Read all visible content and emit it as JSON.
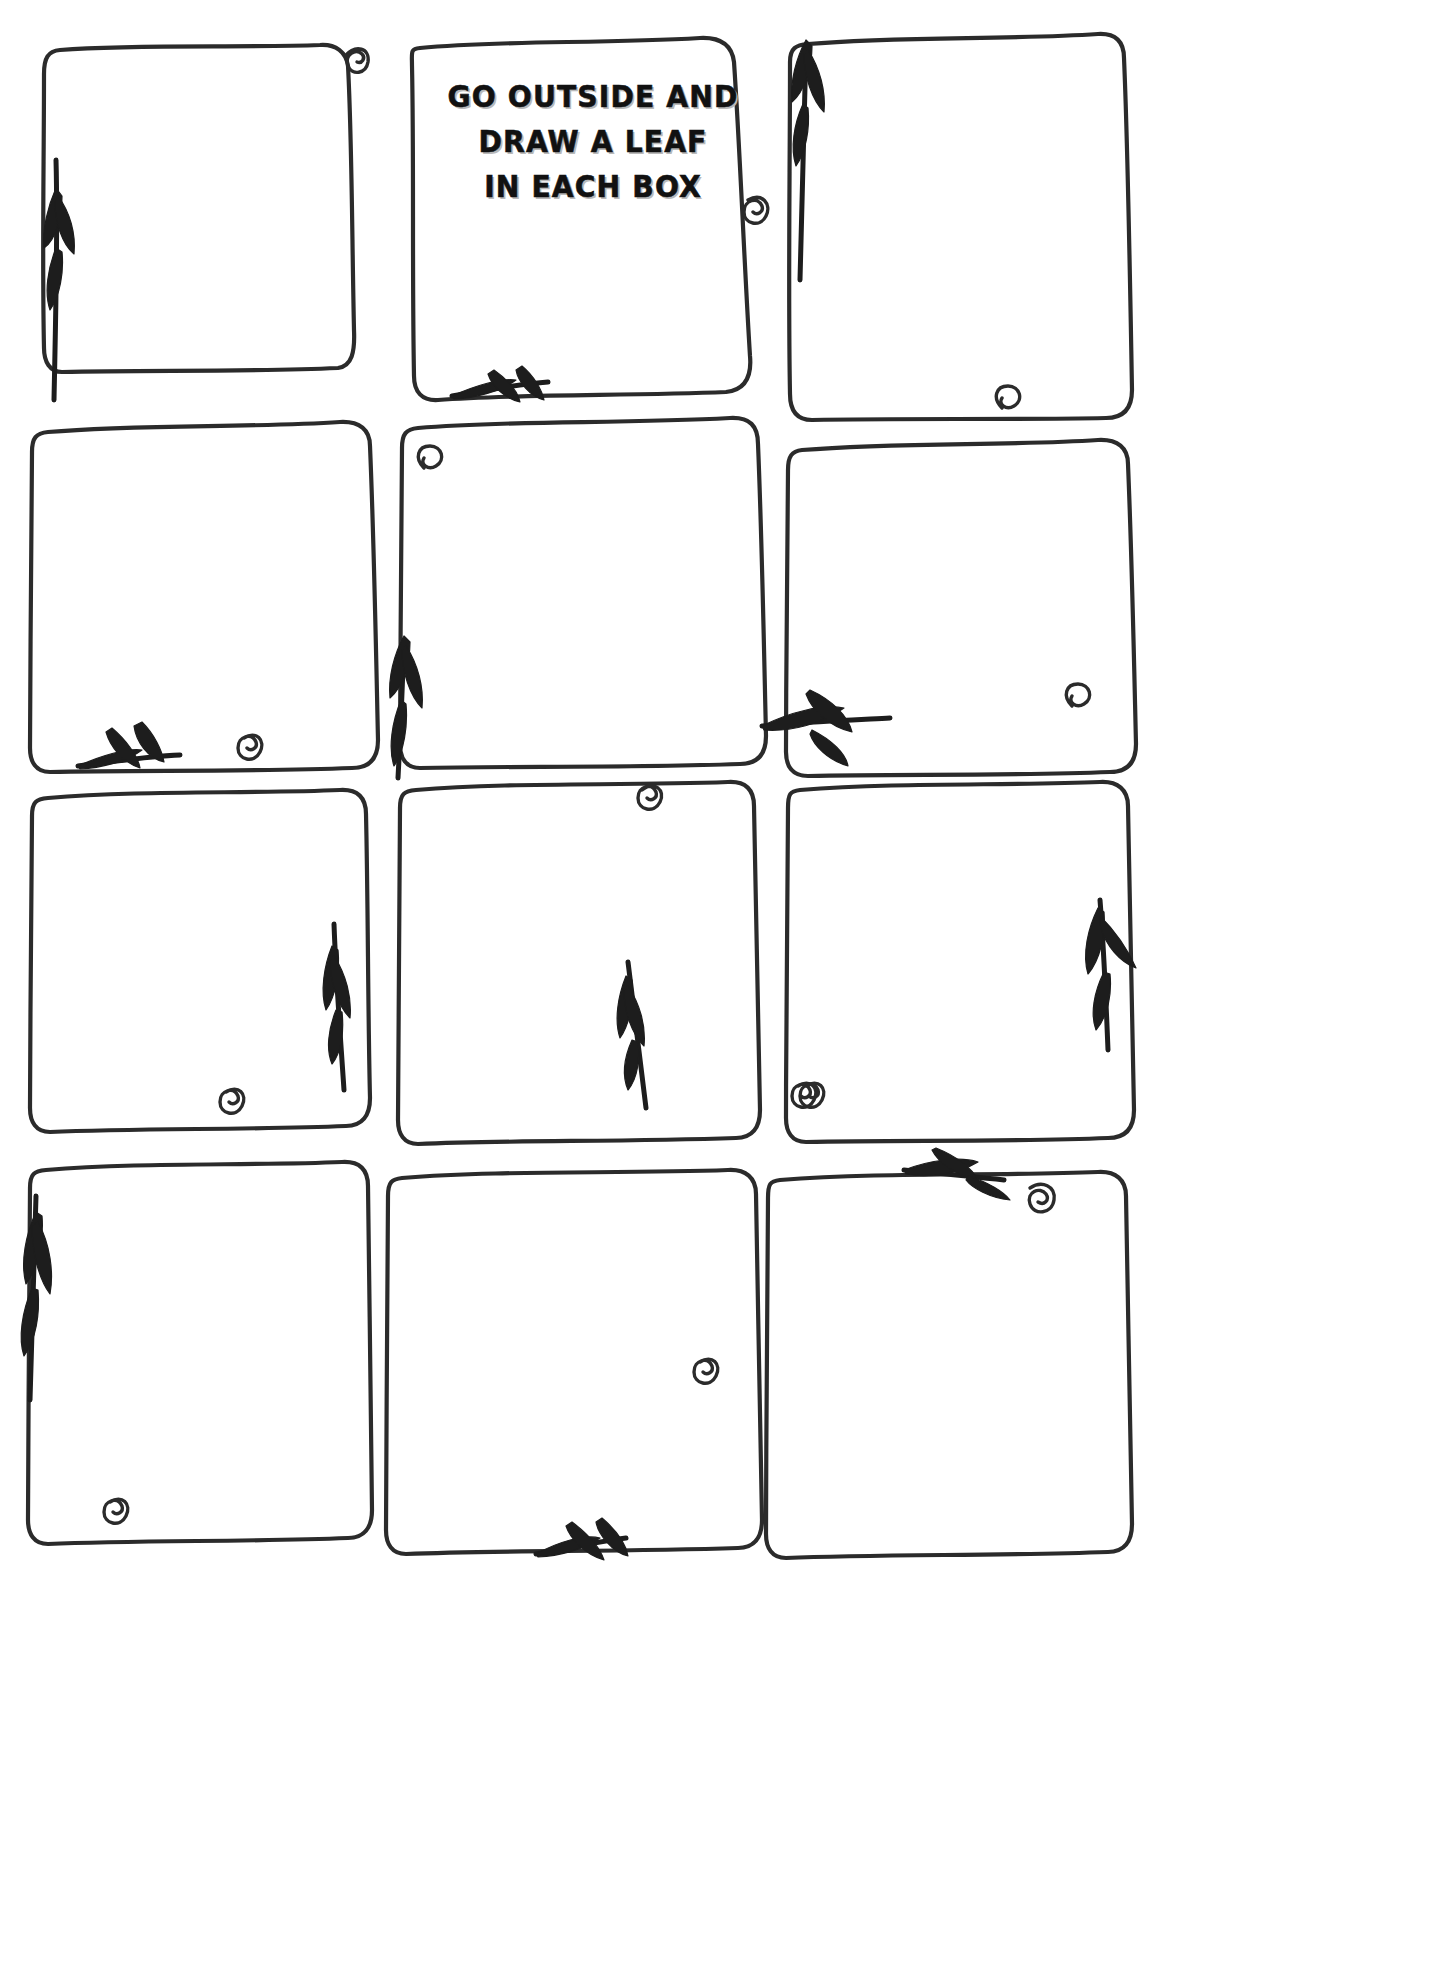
{
  "document": {
    "kind": "printable-worksheet",
    "page_background": "#ffffff",
    "ink_color": "#2b2b2b",
    "leaf_color": "#1d1d1d"
  },
  "title": {
    "name": "instruction-heading",
    "lines": [
      "GO OUTSIDE AND",
      "DRAW A LEAF",
      "IN EACH BOX"
    ],
    "full_text": "GO OUTSIDE AND DRAW A LEAF IN EACH BOX",
    "in_cell": 2
  },
  "grid": {
    "columns": 3,
    "rows": 4,
    "total_boxes": 12
  },
  "boxes": [
    {
      "index": 1,
      "row": 1,
      "col": 1,
      "content": "",
      "decorations": [
        "spiral-top-right",
        "leaf-spray-left-upward"
      ]
    },
    {
      "index": 2,
      "row": 1,
      "col": 2,
      "content": "GO OUTSIDE AND DRAW A LEAF IN EACH BOX",
      "decorations": [
        "spiral-right",
        "leaf-spray-bottom-left-pointing"
      ]
    },
    {
      "index": 3,
      "row": 1,
      "col": 3,
      "content": "",
      "decorations": [
        "leaf-spray-top-left-upward",
        "spiral-bottom-right"
      ]
    },
    {
      "index": 4,
      "row": 2,
      "col": 1,
      "content": "",
      "decorations": [
        "leaf-spray-bottom-left",
        "spiral-bottom"
      ]
    },
    {
      "index": 5,
      "row": 2,
      "col": 2,
      "content": "",
      "decorations": [
        "spiral-top-left",
        "leaf-spray-bottom-left-upward"
      ]
    },
    {
      "index": 6,
      "row": 2,
      "col": 3,
      "content": "",
      "decorations": [
        "leaf-spray-left-pointing-right",
        "spiral-bottom-right"
      ]
    },
    {
      "index": 7,
      "row": 3,
      "col": 1,
      "content": "",
      "decorations": [
        "leaf-spray-right-downward",
        "spiral-bottom"
      ]
    },
    {
      "index": 8,
      "row": 3,
      "col": 2,
      "content": "",
      "decorations": [
        "spiral-top-right",
        "leaf-spray-bottom-left-downward",
        "spiral-bottom-left"
      ]
    },
    {
      "index": 9,
      "row": 3,
      "col": 3,
      "content": "",
      "decorations": [
        "leaf-spray-right-downward",
        "spiral-bottom-left"
      ]
    },
    {
      "index": 10,
      "row": 4,
      "col": 1,
      "content": "",
      "decorations": [
        "leaf-spray-left-downward",
        "spiral-bottom-left"
      ]
    },
    {
      "index": 11,
      "row": 4,
      "col": 2,
      "content": "",
      "decorations": [
        "spiral-bottom-right-inner",
        "leaf-spray-bottom-pointing-left"
      ]
    },
    {
      "index": 12,
      "row": 4,
      "col": 3,
      "content": "",
      "decorations": [
        "leaf-spray-top-pointing-left",
        "spiral-top-right"
      ]
    }
  ]
}
